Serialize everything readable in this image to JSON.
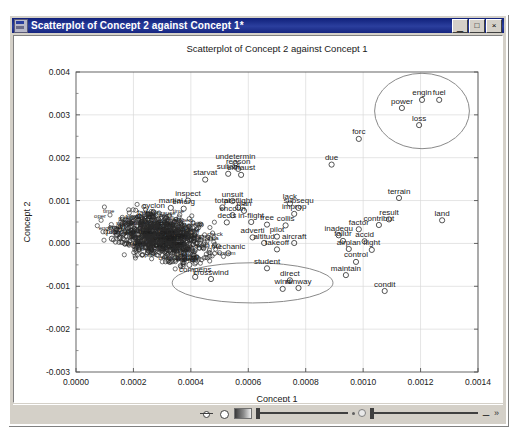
{
  "window": {
    "title": "Scatterplot of Concept 2 against Concept 1*",
    "icon": "chart-window-icon",
    "minimize_label": "_",
    "maximize_label": "□",
    "close_label": "×"
  },
  "statusbar": {
    "pan_icon": "pan-tool-icon",
    "circle_icon": "circle-select-icon",
    "gradient_icon": "gradient-icon",
    "slider_left_icon": "contrast-slider",
    "slider_right_icon": "brightness-slider",
    "key_icon": "key-icon",
    "expand_icon": "expand-icon"
  },
  "chart_data": {
    "type": "scatter",
    "title": "Scatterplot of Concept 2 against Concept 1",
    "xlabel": "Concept 1",
    "ylabel": "Concept 2",
    "xlim": [
      0.0,
      0.0014
    ],
    "ylim": [
      -0.003,
      0.004
    ],
    "xticks": [
      "0.0000",
      "0.0002",
      "0.0004",
      "0.0006",
      "0.0008",
      "0.0010",
      "0.0012",
      "0.0014"
    ],
    "xtick_values": [
      0.0,
      0.0002,
      0.0004,
      0.0006,
      0.0008,
      0.001,
      0.0012,
      0.0014
    ],
    "yticks": [
      "0.004",
      "0.003",
      "0.002",
      "0.001",
      "0.000",
      "-0.001",
      "-0.002",
      "-0.003"
    ],
    "ytick_values": [
      0.004,
      0.003,
      0.002,
      0.001,
      0.0,
      -0.001,
      -0.002,
      -0.003
    ],
    "grid": true,
    "legend": "none",
    "marker": "open-circle",
    "points": [
      {
        "label": "engin",
        "x": 0.001205,
        "y": 0.00335
      },
      {
        "label": "fuel",
        "x": 0.001265,
        "y": 0.00335
      },
      {
        "label": "power",
        "x": 0.001135,
        "y": 0.00316
      },
      {
        "label": "loss",
        "x": 0.001195,
        "y": 0.00276
      },
      {
        "label": "forc",
        "x": 0.000985,
        "y": 0.00244
      },
      {
        "label": "due",
        "x": 0.00089,
        "y": 0.00184
      },
      {
        "label": "undetermin",
        "x": 0.000555,
        "y": 0.00187
      },
      {
        "label": "reason",
        "x": 0.000565,
        "y": 0.00174
      },
      {
        "label": "suitabl",
        "x": 0.00053,
        "y": 0.001625
      },
      {
        "label": "exhaust",
        "x": 0.000575,
        "y": 0.0016
      },
      {
        "label": "starvat",
        "x": 0.00045,
        "y": 0.00149
      },
      {
        "label": "terrain",
        "x": 0.001125,
        "y": 0.00106
      },
      {
        "label": "inspect",
        "x": 0.00039,
        "y": 0.001
      },
      {
        "label": "unsuit",
        "x": 0.000545,
        "y": 0.00099
      },
      {
        "label": "lack",
        "x": 0.000745,
        "y": 0.00093
      },
      {
        "label": "total",
        "x": 0.00051,
        "y": 0.00084
      },
      {
        "label": "preflight",
        "x": 0.000565,
        "y": 0.00084
      },
      {
        "label": "subsequ",
        "x": 0.000775,
        "y": 0.00083
      },
      {
        "label": "martial",
        "x": 0.00033,
        "y": 0.00083
      },
      {
        "label": "emerg",
        "x": 0.000375,
        "y": 0.00081
      },
      {
        "label": "plan",
        "x": 0.000585,
        "y": 0.00076
      },
      {
        "label": "improp",
        "x": 0.00076,
        "y": 0.00069
      },
      {
        "label": "encoun",
        "x": 0.000545,
        "y": 0.00066
      },
      {
        "label": "result",
        "x": 0.00109,
        "y": 0.00056
      },
      {
        "label": "land",
        "x": 0.001275,
        "y": 0.00054
      },
      {
        "label": "in-flight",
        "x": 0.00061,
        "y": 0.0005
      },
      {
        "label": "decis",
        "x": 0.000525,
        "y": 0.00049
      },
      {
        "label": "tree",
        "x": 0.000665,
        "y": 0.00044
      },
      {
        "label": "collis",
        "x": 0.00073,
        "y": 0.00042
      },
      {
        "label": "contribut",
        "x": 0.001055,
        "y": 0.00043
      },
      {
        "label": "factor",
        "x": 0.000985,
        "y": 0.00033
      },
      {
        "label": "inadequ",
        "x": 0.000915,
        "y": 0.00019
      },
      {
        "label": "pilot",
        "x": 0.0007,
        "y": 0.00016
      },
      {
        "label": "adverti",
        "x": 0.000615,
        "y": 0.00014
      },
      {
        "label": "altitud",
        "x": 0.000655,
        "y": 1e-05
      },
      {
        "label": "aircraft",
        "x": 0.00076,
        "y": 1e-05
      },
      {
        "label": "failur",
        "x": 0.00093,
        "y": 6e-05
      },
      {
        "label": "accid",
        "x": 0.001005,
        "y": 5e-05
      },
      {
        "label": "airplan",
        "x": 0.00095,
        "y": -0.00013
      },
      {
        "label": "flight",
        "x": 0.00103,
        "y": -0.00015
      },
      {
        "label": "takeoff",
        "x": 0.0007,
        "y": -0.00014
      },
      {
        "label": "mechanic",
        "x": 0.00053,
        "y": -0.00023
      },
      {
        "label": "gusti",
        "x": 0.000395,
        "y": -0.0005
      },
      {
        "label": "control",
        "x": 0.000975,
        "y": -0.00043
      },
      {
        "label": "student",
        "x": 0.000665,
        "y": -0.00058
      },
      {
        "label": "compens",
        "x": 0.000415,
        "y": -0.00078
      },
      {
        "label": "crosswind",
        "x": 0.00047,
        "y": -0.00083
      },
      {
        "label": "maintain",
        "x": 0.00094,
        "y": -0.00074
      },
      {
        "label": "direct",
        "x": 0.000745,
        "y": -0.00086
      },
      {
        "label": "wind",
        "x": 0.00072,
        "y": -0.00106
      },
      {
        "label": "runway",
        "x": 0.000775,
        "y": -0.00104
      },
      {
        "label": "condit",
        "x": 0.001075,
        "y": -0.00111
      },
      {
        "label": "chec",
        "x": 0.000235,
        "y": 0.00046
      },
      {
        "label": "fail",
        "x": 0.00023,
        "y": 0.00056
      },
      {
        "label": "pre",
        "x": 0.000125,
        "y": 0.00011
      },
      {
        "label": "air",
        "x": 0.00016,
        "y": 0.00024
      },
      {
        "label": "cyclon",
        "x": 0.00027,
        "y": 0.00072
      }
    ],
    "ellipses": [
      {
        "name": "upper-right-cluster-ellipse",
        "cx": 0.001205,
        "cy": 0.00309,
        "rx": 0.000165,
        "ry": 0.00088
      },
      {
        "name": "lower-center-cluster-ellipse",
        "cx": 0.000615,
        "cy": -0.00092,
        "rx": 0.00028,
        "ry": 0.00047
      }
    ],
    "dense_cluster": {
      "description": "dense overlapping mass of open-circle markers with tiny labels",
      "x_range": [
        5e-05,
        0.00055
      ],
      "y_range": [
        -0.00065,
        0.00095
      ],
      "approx_count": 900
    }
  }
}
